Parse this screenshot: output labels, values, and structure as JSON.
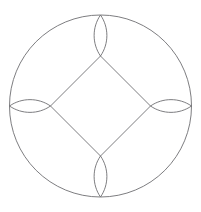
{
  "canvas": {
    "width": 201,
    "height": 212,
    "background_color": "#ffffff",
    "title": "Geometric Figure"
  },
  "style": {
    "stroke_color": "#6e6e72",
    "stroke_width": 0.9,
    "fill": "none"
  },
  "chart_data": {
    "type": "diagram",
    "title": "",
    "subtitle": "",
    "xlabel": "",
    "ylabel": "",
    "legend": [],
    "annotations": [],
    "grid": false,
    "center": {
      "x": 100.5,
      "y": 106.0
    },
    "shapes": [
      {
        "name": "outer-circle",
        "kind": "circle",
        "cx": 100.5,
        "cy": 106.0,
        "r": 91.0
      },
      {
        "name": "inner-diamond",
        "kind": "polygon",
        "points": [
          {
            "x": 100.5,
            "y": 56.0
          },
          {
            "x": 150.5,
            "y": 106.0
          },
          {
            "x": 100.5,
            "y": 156.0
          },
          {
            "x": 50.5,
            "y": 106.0
          }
        ]
      },
      {
        "name": "lens-top",
        "kind": "lens",
        "tip_a": {
          "x": 100.5,
          "y": 15.0
        },
        "tip_b": {
          "x": 100.5,
          "y": 56.0
        },
        "bulge": 8.5,
        "orientation": "vertical"
      },
      {
        "name": "lens-bottom",
        "kind": "lens",
        "tip_a": {
          "x": 100.5,
          "y": 156.0
        },
        "tip_b": {
          "x": 100.5,
          "y": 197.0
        },
        "bulge": 8.5,
        "orientation": "vertical"
      },
      {
        "name": "lens-left",
        "kind": "lens",
        "tip_a": {
          "x": 9.5,
          "y": 106.0
        },
        "tip_b": {
          "x": 50.5,
          "y": 106.0
        },
        "bulge": 8.5,
        "orientation": "horizontal"
      },
      {
        "name": "lens-right",
        "kind": "lens",
        "tip_a": {
          "x": 150.5,
          "y": 106.0
        },
        "tip_b": {
          "x": 191.5,
          "y": 106.0
        },
        "bulge": 8.5,
        "orientation": "horizontal"
      }
    ]
  }
}
